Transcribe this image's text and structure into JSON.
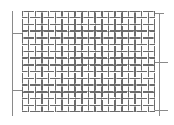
{
  "figure": {
    "kind": "technical-line-drawing",
    "canvas": {
      "width": 174,
      "height": 125,
      "background": "#ffffff"
    }
  },
  "mesh": {
    "name": "plain-weave-wire-mesh",
    "x": 22,
    "y": 11,
    "width": 133,
    "height": 101,
    "columns": 20,
    "rows": 15,
    "cell_width": 6.65,
    "cell_height": 6.733,
    "wire_color": "#6b6b6b",
    "wire_light_color": "#a8a8a8",
    "wire_thickness": 1.5,
    "weave_gap": 1.1,
    "opening_fill": "#fdfdfd"
  },
  "dimension_lines": {
    "color": "#8a8a8a",
    "thickness": 1,
    "left": {
      "name": "left-extension-line",
      "x": 12,
      "y_top": 11,
      "y_bottom": 116,
      "ticks": [
        {
          "name": "left-tick-upper",
          "y": 33,
          "x_start": 12,
          "x_end": 22
        },
        {
          "name": "left-tick-lower",
          "y": 90,
          "x_start": 12,
          "x_end": 22
        }
      ]
    },
    "right": {
      "name": "right-extension-line",
      "x": 159,
      "y_top": 13,
      "y_bottom": 116,
      "ticks": [
        {
          "name": "right-tick-upper",
          "y": 13,
          "x_start": 152,
          "x_end": 164
        },
        {
          "name": "right-tick-middle",
          "y": 62,
          "x_start": 152,
          "x_end": 168
        },
        {
          "name": "right-tick-lower",
          "y": 110,
          "x_start": 152,
          "x_end": 168
        }
      ]
    }
  },
  "labels": {
    "visible_text": []
  }
}
